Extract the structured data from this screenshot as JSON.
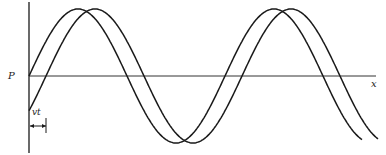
{
  "diagram": {
    "labels": {
      "y_axis": "P",
      "x_axis": "x",
      "shift": "vt"
    },
    "colors": {
      "stroke": "#1a1a1a",
      "background": "#ffffff"
    },
    "waves": [
      {
        "name": "wave-at-t0",
        "phase_shift_px": 0
      },
      {
        "name": "wave-at-t",
        "phase_shift_px": 17
      }
    ]
  }
}
